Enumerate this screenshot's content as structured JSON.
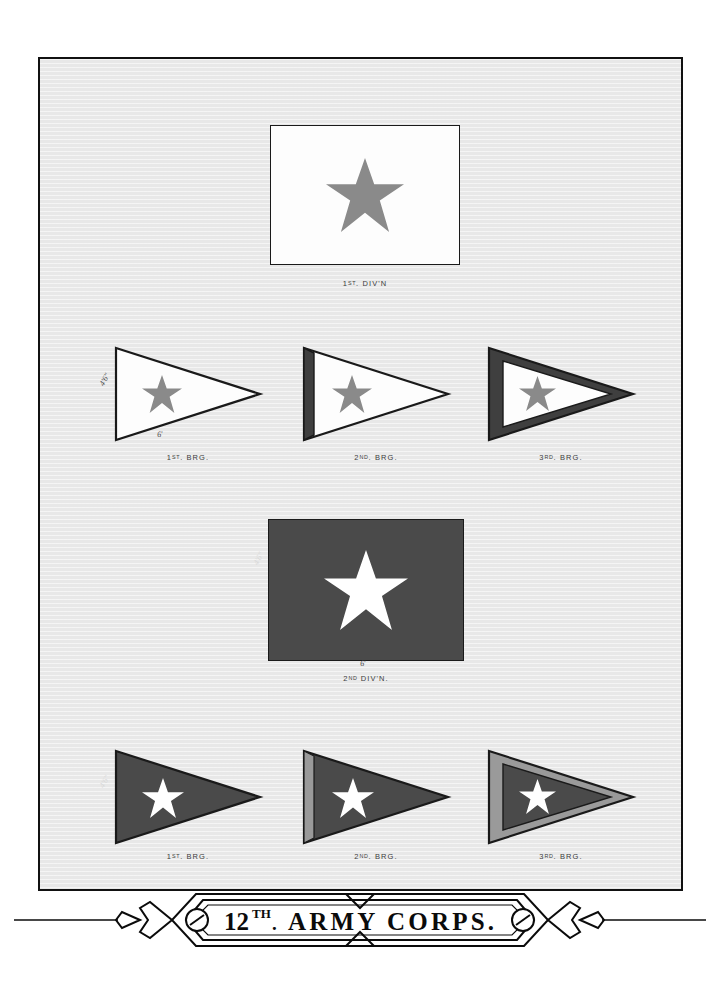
{
  "plate": {
    "title_main": "ARMY CORPS.",
    "title_number": "12",
    "title_ordinal": "TH",
    "title_ordinal_period": ".",
    "background_color": "#e8e8e8",
    "frame_color": "#111111"
  },
  "colors": {
    "first_division_field": "#fdfdfd",
    "first_division_star": "#8a8a8a",
    "second_division_field": "#4a4a4a",
    "second_division_star": "#ffffff",
    "dark_border": "#3f3f3f",
    "light_border": "#9a9a9a",
    "outline": "#1a1a1a"
  },
  "divisions": [
    {
      "id": "first-division",
      "label": "1",
      "label_ordinal": "ST",
      "label_rest": ". DIV'N",
      "caption": "1ST. DIV'N",
      "field": "white",
      "star": "gray",
      "dim_height": "4'6\"",
      "dim_width": "6'"
    },
    {
      "id": "second-division",
      "label": "2",
      "label_ordinal": "ND",
      "label_rest": " DIV'N.",
      "caption": "2ND DIV'N.",
      "field": "dark",
      "star": "white",
      "dim_height": "4'6\"",
      "dim_width": "6'"
    }
  ],
  "brigades_first_division": [
    {
      "id": "div1-brigade-1",
      "number": "1",
      "ordinal": "ST",
      "rest": ". BRG.",
      "caption": "1ST. BRG.",
      "border_style": "none",
      "field": "white",
      "star": "gray",
      "dim_height": "4'6\"",
      "dim_hyp": "6'"
    },
    {
      "id": "div1-brigade-2",
      "number": "2",
      "ordinal": "ND",
      "rest": ". BRG.",
      "caption": "2ND. BRG.",
      "border_style": "hoist-stripe-dark",
      "field": "white",
      "star": "gray"
    },
    {
      "id": "div1-brigade-3",
      "number": "3",
      "ordinal": "RD",
      "rest": ". BRG.",
      "caption": "3RD. BRG.",
      "border_style": "full-border-dark",
      "field": "white",
      "star": "gray"
    }
  ],
  "brigades_second_division": [
    {
      "id": "div2-brigade-1",
      "number": "1",
      "ordinal": "ST",
      "rest": ". BRG.",
      "caption": "1ST. BRG.",
      "border_style": "none",
      "field": "dark",
      "star": "white",
      "dim_height": "4'6\""
    },
    {
      "id": "div2-brigade-2",
      "number": "2",
      "ordinal": "ND",
      "rest": ". BRG.",
      "caption": "2ND. BRG.",
      "border_style": "hoist-stripe-light",
      "field": "dark",
      "star": "white"
    },
    {
      "id": "div2-brigade-3",
      "number": "3",
      "ordinal": "RD",
      "rest": ". BRG.",
      "caption": "3RD. BRG.",
      "border_style": "full-border-light",
      "field": "dark",
      "star": "white"
    }
  ]
}
